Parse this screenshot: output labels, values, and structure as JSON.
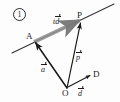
{
  "figure": {
    "number_label": "1",
    "caption": "",
    "background_color": "#fdfdfd",
    "stroke_color": "#1c1c1c",
    "highlight_color": "#9a9a9a",
    "width": 120,
    "height": 102
  },
  "points": {
    "A": {
      "label": "A",
      "x": 33,
      "y": 40
    },
    "P": {
      "label": "P",
      "x": 81,
      "y": 21
    },
    "O": {
      "label": "O",
      "x": 67,
      "y": 88
    },
    "D": {
      "label": "D",
      "x": 92,
      "y": 74
    }
  },
  "vectors": [
    {
      "name": "a-vector",
      "label": "a",
      "accent": "arrow",
      "from": "O",
      "to": "A",
      "style": "thin-solid-arrow"
    },
    {
      "name": "p-vector",
      "label": "p",
      "accent": "arrow",
      "from": "O",
      "to": "P",
      "style": "thin-solid-arrow"
    },
    {
      "name": "d-vector",
      "label": "d",
      "accent": "arrow",
      "from": "O",
      "to": "D",
      "style": "thin-solid-arrow"
    },
    {
      "name": "td-vector",
      "label_prefix": "t",
      "label": "d",
      "accent": "arrow",
      "from": "A",
      "to": "P",
      "style": "thick-gray-arrow"
    }
  ],
  "line": {
    "name": "line-through-A-and-P",
    "from_x": 12,
    "from_y": 53,
    "to_x": 114,
    "to_y": 4
  },
  "labels": {
    "A": "A",
    "P": "P",
    "O": "O",
    "D": "D",
    "t": "t",
    "d": "d",
    "p": "p",
    "a": "a",
    "circled_number": "1"
  }
}
